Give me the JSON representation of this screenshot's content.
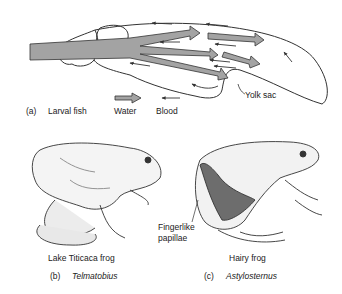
{
  "panel_a": {
    "letter": "(a)",
    "title": "Larval fish",
    "legend": {
      "water_label": "Water",
      "blood_label": "Blood"
    },
    "yolk_sac_label": "Yolk sac"
  },
  "panel_b": {
    "letter": "(b)",
    "common_name": "Lake Titicaca frog",
    "genus": "Telmatobius"
  },
  "panel_c": {
    "letter": "(c)",
    "common_name": "Hairy frog",
    "genus": "Astylosternus",
    "annotation": {
      "line1": "Fingerlike",
      "line2": "papillae"
    }
  },
  "colors": {
    "water_arrow": "#9a9a9a",
    "outline": "#333333",
    "background": "#ffffff"
  }
}
